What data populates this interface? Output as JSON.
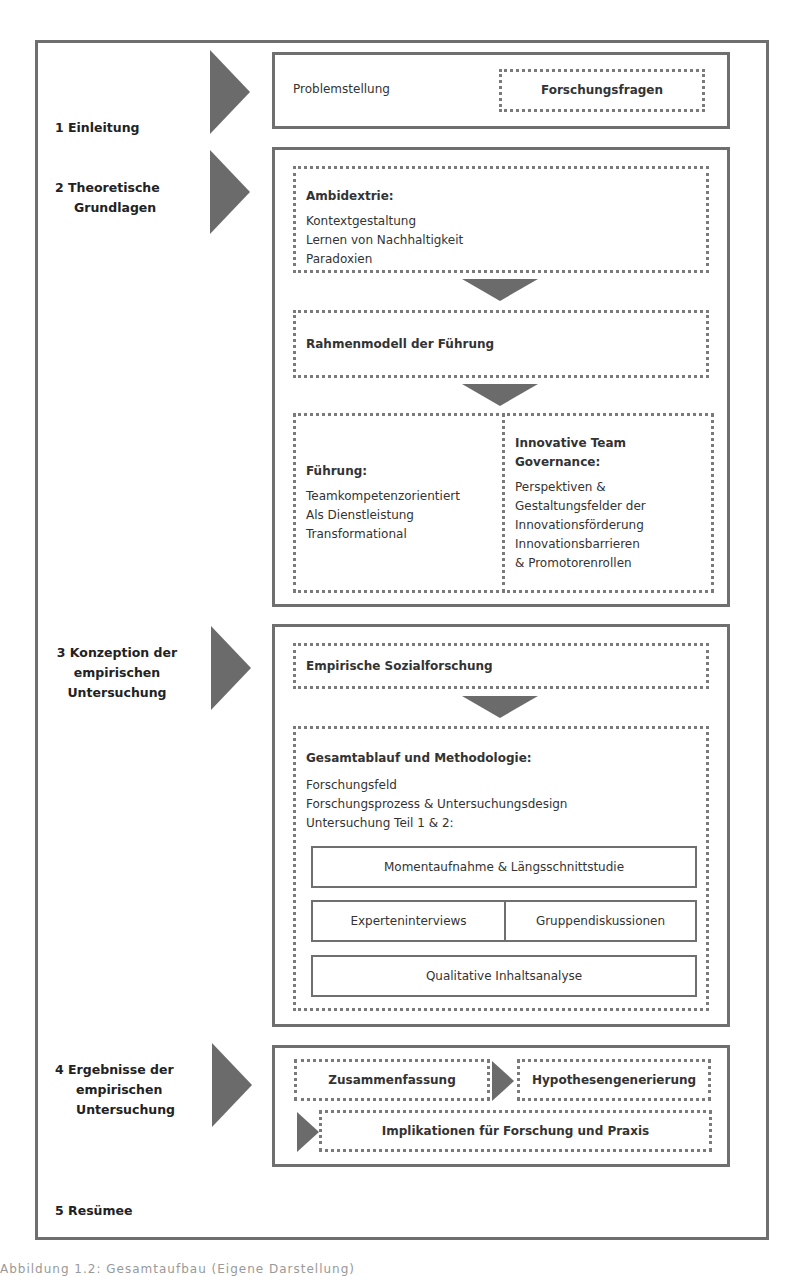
{
  "sections": [
    {
      "number": "1",
      "label": "1 Einleitung"
    },
    {
      "number": "2",
      "label_line1": "2 Theoretische",
      "label_line2": "Grundlagen"
    },
    {
      "number": "3",
      "label_line1": "3 Konzeption der",
      "label_line2": "empirischen",
      "label_line3": "Untersuchung"
    },
    {
      "number": "4",
      "label_line1": "4 Ergebnisse der",
      "label_line2": "empirischen",
      "label_line3": "Untersuchung"
    },
    {
      "number": "5",
      "label": "5 Resümee"
    }
  ],
  "einleitung": {
    "problem": "Problemstellung",
    "fragen": "Forschungsfragen"
  },
  "grundlagen": {
    "ambidextrie": {
      "title": "Ambidextrie:",
      "items": [
        "Kontextgestaltung",
        "Lernen von Nachhaltigkeit",
        "Paradoxien"
      ]
    },
    "rahmenmodell": "Rahmenmodell der Führung",
    "fuehrung": {
      "title": "Führung:",
      "items": [
        "Teamkompetenzorientiert",
        "Als Dienstleistung",
        "Transformational"
      ]
    },
    "governance": {
      "title_line1": "Innovative Team",
      "title_line2": "Governance:",
      "items": [
        "Perspektiven &",
        "Gestaltungsfelder der",
        "Innovationsförderung",
        "Innovationsbarrieren",
        "& Promotorenrollen"
      ]
    }
  },
  "konzeption": {
    "sozialforschung": "Empirische Sozialforschung",
    "gesamtablauf": {
      "title": "Gesamtablauf und Methodologie:",
      "items": [
        "Forschungsfeld",
        "Forschungsprozess & Untersuchungsdesign",
        "Untersuchung Teil 1 & 2:"
      ]
    },
    "momentaufnahme": "Momentaufnahme & Längsschnittstudie",
    "experteninterviews": "Experteninterviews",
    "gruppendiskussionen": "Gruppendiskussionen",
    "inhaltsanalyse": "Qualitative Inhaltsanalyse"
  },
  "ergebnisse": {
    "zusammenfassung": "Zusammenfassung",
    "hypothesen": "Hypothesengenerierung",
    "implikationen": "Implikationen für Forschung und Praxis"
  },
  "caption": "Abbildung 1.2: Gesamtaufbau (Eigene Darstellung)",
  "colors": {
    "frame": "#6f6f6f",
    "arrow": "#6b6b6b",
    "text": "#222222"
  }
}
